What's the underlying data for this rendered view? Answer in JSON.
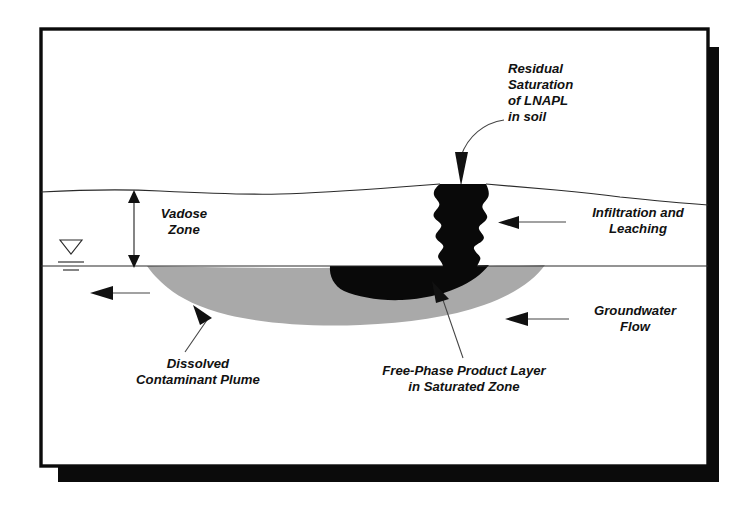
{
  "figure": {
    "background_color": "#ffffff",
    "frame": {
      "border_color": "#0b0b0b",
      "shadow_color": "#0b0b0b",
      "inner_fill": "#ffffff"
    }
  },
  "palette": {
    "ink": "#111111",
    "line": "#2a2a2a",
    "dissolved_plume_gray": "#a9a9a9",
    "free_phase_black": "#090909",
    "paper": "#ffffff"
  },
  "labels": {
    "residual_saturation": {
      "name": "residual-saturation-of-lnapl-in-soil",
      "lines": [
        "Residual",
        "Saturation",
        "of LNAPL",
        "in soil"
      ],
      "line1": "Residual",
      "line2": "Saturation",
      "line3": "of LNAPL",
      "line4": "in soil",
      "align": "left",
      "leader": "curved-arrow-down-left"
    },
    "infiltration_leaching": {
      "name": "infiltration-and-leaching",
      "lines": [
        "Infiltration and",
        "Leaching"
      ],
      "line1": "Infiltration and",
      "line2": "Leaching",
      "align": "center",
      "leader": "straight-arrow-left"
    },
    "groundwater_flow": {
      "name": "groundwater-flow",
      "lines": [
        "Groundwater",
        "Flow"
      ],
      "line1": "Groundwater",
      "line2": "Flow",
      "align": "center",
      "leader": "straight-arrow-left"
    },
    "vadose_zone": {
      "name": "vadose-zone",
      "lines": [
        "Vadose",
        "Zone"
      ],
      "line1": "Vadose",
      "line2": "Zone",
      "align": "center",
      "leader": "double-headed-vertical-arrow"
    },
    "dissolved_plume": {
      "name": "dissolved-contaminant-plume",
      "lines": [
        "Dissolved",
        "Contaminant Plume"
      ],
      "line1": "Dissolved",
      "line2": "Contaminant Plume",
      "align": "center",
      "leader": "straight-arrow-up-right"
    },
    "free_phase_layer": {
      "name": "free-phase-product-layer-in-saturated-zone",
      "lines": [
        "Free-Phase Product Layer",
        "in Saturated Zone"
      ],
      "line1": "Free-Phase Product Layer",
      "line2": "in Saturated Zone",
      "align": "center",
      "leader": "straight-arrow-up"
    }
  },
  "symbols": {
    "water_table": {
      "name": "water-table-symbol",
      "glyph": "inverted-triangle-with-two-rules",
      "description": "Standard piezometric water table marker"
    },
    "groundwater_flow_arrow_left": {
      "name": "groundwater-flow-arrow",
      "direction": "left"
    },
    "vadose_arrow": {
      "name": "vadose-zone-extent-arrow",
      "direction": "vertical-double"
    }
  },
  "features": {
    "ground_surface": {
      "name": "ground-surface-line",
      "description": "Undulating land surface"
    },
    "water_table_line": {
      "name": "water-table-line",
      "description": "Horizontal water table boundary"
    },
    "lnapl_source": {
      "name": "lnapl-source-zone",
      "description": "Ragged black vertical column of residual LNAPL from surface to water table",
      "color": "#090909"
    },
    "free_phase_lens": {
      "name": "free-phase-product-lens",
      "description": "Black pancake of free product floating on the water table",
      "color": "#090909"
    },
    "dissolved_plume_lens": {
      "name": "dissolved-contaminant-plume-lens",
      "description": "Gray tapering plume migrating downgradient in the saturated zone",
      "color": "#a9a9a9"
    }
  }
}
